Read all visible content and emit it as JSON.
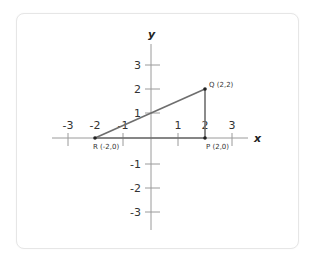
{
  "diagram": {
    "type": "coordinate-plane",
    "axes": {
      "x_label": "x",
      "y_label": "y",
      "x_ticks": [
        "-3",
        "-2",
        "-1",
        "1",
        "2",
        "3"
      ],
      "y_ticks_positive": [
        "3",
        "2",
        "1"
      ],
      "y_ticks_negative": [
        "-1",
        "-2",
        "-3"
      ]
    },
    "points": [
      {
        "name": "P",
        "label": "P (2,0)",
        "x": 2,
        "y": 0
      },
      {
        "name": "Q",
        "label": "Q (2,2)",
        "x": 2,
        "y": 2
      },
      {
        "name": "R",
        "label": "R (-2,0)",
        "x": -2,
        "y": 0
      }
    ],
    "segments": [
      [
        "R",
        "Q"
      ],
      [
        "Q",
        "P"
      ],
      [
        "P",
        "R"
      ]
    ],
    "colors": {
      "axis": "#9a9a9a",
      "triangle": "#6e6e6e",
      "point": "#222222",
      "card_border": "#e6e6e6"
    }
  }
}
